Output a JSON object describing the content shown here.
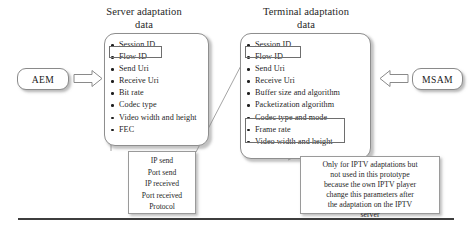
{
  "figure": {
    "title_server": "Server adaptation\ndata",
    "title_terminal": "Terminal adaptation\ndata"
  },
  "captions": {
    "server_line1": "Server adaptation",
    "server_line2": "data",
    "terminal_line1": "Terminal adaptation",
    "terminal_line2": "data"
  },
  "endpoints": {
    "left_label": "AEM",
    "right_label": "MSAM"
  },
  "server_panel": {
    "items": [
      "Session ID",
      "Flow ID",
      "Send Uri",
      "Receive Uri",
      "Bit rate",
      "Codec type",
      "Video width and height",
      "FEC"
    ],
    "highlighted": [
      "Flow ID"
    ]
  },
  "terminal_panel": {
    "items": [
      "Session ID",
      "Flow ID",
      "Send Uri",
      "Receive Uri",
      "Buffer size and algorithm",
      "Packetization algorithm",
      "Codec type and mode",
      "Frame rate",
      "Video width and height"
    ],
    "highlighted": [
      "Flow ID",
      "Frame rate",
      "Video width and height"
    ]
  },
  "note_fec": {
    "lines": [
      "IP send",
      "Port send",
      "IP received",
      "Port received",
      "Protocol"
    ]
  },
  "note_iptv": {
    "lines": [
      "Only for IPTV adaptations but",
      "not used in this prototype",
      "because the own IPTV player",
      "change this parameters after",
      "the adaptation on the IPTV",
      "server"
    ]
  },
  "colors": {
    "box_border": "#8e8e8e",
    "text": "#1f1f1f",
    "rule": "#3d3d3d",
    "shadow": "rgba(120,120,120,0.45)"
  }
}
